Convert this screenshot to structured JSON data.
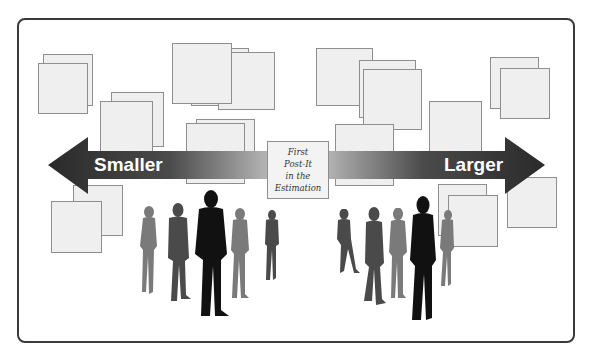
{
  "diagram": {
    "title": "",
    "center_note": {
      "text": "First\nPost-It\nin the\nEstimation"
    },
    "arrows": {
      "left": {
        "label": "Smaller",
        "direction": "left"
      },
      "right": {
        "label": "Larger",
        "direction": "right"
      }
    },
    "colors": {
      "frame": "#3a3a3a",
      "note_fill": "#efefef",
      "note_border": "#8e8e8e",
      "arrow_dark": "#2e2e2e",
      "arrow_light": "#9a9a9a",
      "silhouette_dark": "#111111",
      "silhouette_mid": "#4a4a4a",
      "silhouette_light": "#7a7a7a"
    },
    "sticky_notes_count": 25,
    "people_count": 10
  }
}
